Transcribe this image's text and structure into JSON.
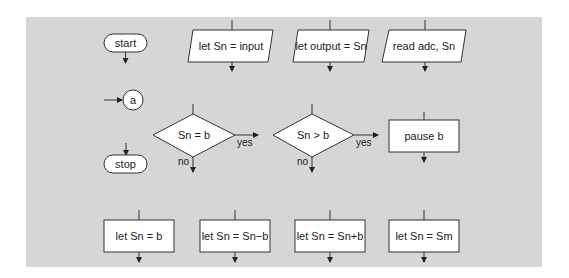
{
  "diagram": {
    "background_color": "#d6d6d6",
    "symbols": {
      "start": "start",
      "stop": "stop",
      "connector": "a",
      "input_1": "let Sn = input",
      "output_1": "let output = Sn",
      "input_2": "read adc, Sn",
      "decision_1": "Sn = b",
      "decision_2": "Sn > b",
      "process_pause": "pause b",
      "process_1": "let Sn = b",
      "process_2": "let Sn = Sn−b",
      "process_3": "let Sn = Sn+b",
      "process_4": "let Sn = Sm"
    },
    "branch_labels": {
      "decision_1_yes": "yes",
      "decision_1_no": "no",
      "decision_2_yes": "yes",
      "decision_2_no": "no"
    }
  }
}
